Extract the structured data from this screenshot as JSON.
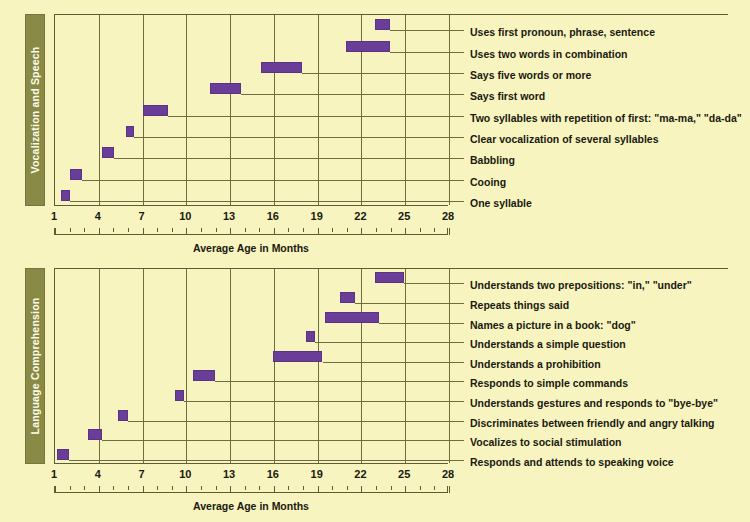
{
  "figure": {
    "background_color": "#f7f4bf",
    "bar_color": "#6a3d99",
    "tab_color": "#8a8a47",
    "grid_color": "#6d6d3d"
  },
  "axis": {
    "title": "Average Age in Months",
    "min": 1,
    "max": 28,
    "major_step": 3,
    "minor_step": 1,
    "tick_labels": [
      "1",
      "4",
      "7",
      "10",
      "13",
      "16",
      "19",
      "22",
      "25",
      "28"
    ]
  },
  "panels": [
    {
      "id": "speech",
      "category": "Vocalization and Speech",
      "rows": [
        {
          "label": "Uses first pronoun, phrase, sentence",
          "start": 23.0,
          "end": 24.0
        },
        {
          "label": "Uses two words in combination",
          "start": 21.0,
          "end": 24.0
        },
        {
          "label": "Says five words or more",
          "start": 15.2,
          "end": 18.0
        },
        {
          "label": "Says first word",
          "start": 11.7,
          "end": 13.8
        },
        {
          "label": "Two syllables with repetition of first: \"ma-ma,\" \"da-da\"",
          "start": 7.1,
          "end": 8.8
        },
        {
          "label": "Clear vocalization of several syllables",
          "start": 5.9,
          "end": 6.5
        },
        {
          "label": "Babbling",
          "start": 4.3,
          "end": 5.1
        },
        {
          "label": "Cooing",
          "start": 2.1,
          "end": 2.9
        },
        {
          "label": "One syllable",
          "start": 1.5,
          "end": 2.1
        }
      ]
    },
    {
      "id": "comprehension",
      "category": "Language Comprehension",
      "rows": [
        {
          "label": "Understands two prepositions: \"in,\" \"under\"",
          "start": 23.0,
          "end": 25.0
        },
        {
          "label": "Repeats things said",
          "start": 20.6,
          "end": 21.6
        },
        {
          "label": "Names a picture in a book: \"dog\"",
          "start": 19.6,
          "end": 23.3
        },
        {
          "label": "Understands a simple question",
          "start": 18.3,
          "end": 18.9
        },
        {
          "label": "Understands a prohibition",
          "start": 16.0,
          "end": 19.4
        },
        {
          "label": "Responds to simple commands",
          "start": 10.5,
          "end": 12.0
        },
        {
          "label": "Understands gestures and responds to \"bye-bye\"",
          "start": 9.3,
          "end": 9.9
        },
        {
          "label": "Discriminates between friendly and angry talking",
          "start": 5.4,
          "end": 6.1
        },
        {
          "label": "Vocalizes to social stimulation",
          "start": 3.3,
          "end": 4.3
        },
        {
          "label": "Responds and attends to speaking voice",
          "start": 1.2,
          "end": 2.0
        }
      ]
    }
  ],
  "chart_data": {
    "type": "bar",
    "orientation": "horizontal",
    "title": "",
    "xlabel": "Average Age in Months",
    "ylabel": "",
    "xlim": [
      1,
      28
    ],
    "grid": true,
    "legend": "none",
    "note": "Horizontal range (Gantt-style) bars showing the age window in months during which each language milestone typically appears.",
    "groups": [
      {
        "name": "Vocalization and Speech",
        "categories": [
          "One syllable",
          "Cooing",
          "Babbling",
          "Clear vocalization of several syllables",
          "Two syllables with repetition of first: \"ma-ma,\" \"da-da\"",
          "Says first word",
          "Says five words or more",
          "Uses two words in combination",
          "Uses first pronoun, phrase, sentence"
        ],
        "ranges": [
          [
            1.5,
            2.1
          ],
          [
            2.1,
            2.9
          ],
          [
            4.3,
            5.1
          ],
          [
            5.9,
            6.5
          ],
          [
            7.1,
            8.8
          ],
          [
            11.7,
            13.8
          ],
          [
            15.2,
            18.0
          ],
          [
            21.0,
            24.0
          ],
          [
            23.0,
            24.0
          ]
        ]
      },
      {
        "name": "Language Comprehension",
        "categories": [
          "Responds and attends to speaking voice",
          "Vocalizes to social stimulation",
          "Discriminates between friendly and angry talking",
          "Understands gestures and responds to \"bye-bye\"",
          "Responds to simple commands",
          "Understands a prohibition",
          "Understands a simple question",
          "Names a picture in a book: \"dog\"",
          "Repeats things said",
          "Understands two prepositions: \"in,\" \"under\""
        ],
        "ranges": [
          [
            1.2,
            2.0
          ],
          [
            3.3,
            4.3
          ],
          [
            5.4,
            6.1
          ],
          [
            9.3,
            9.9
          ],
          [
            10.5,
            12.0
          ],
          [
            16.0,
            19.4
          ],
          [
            18.3,
            18.9
          ],
          [
            19.6,
            23.3
          ],
          [
            20.6,
            21.6
          ],
          [
            23.0,
            25.0
          ]
        ]
      }
    ]
  }
}
